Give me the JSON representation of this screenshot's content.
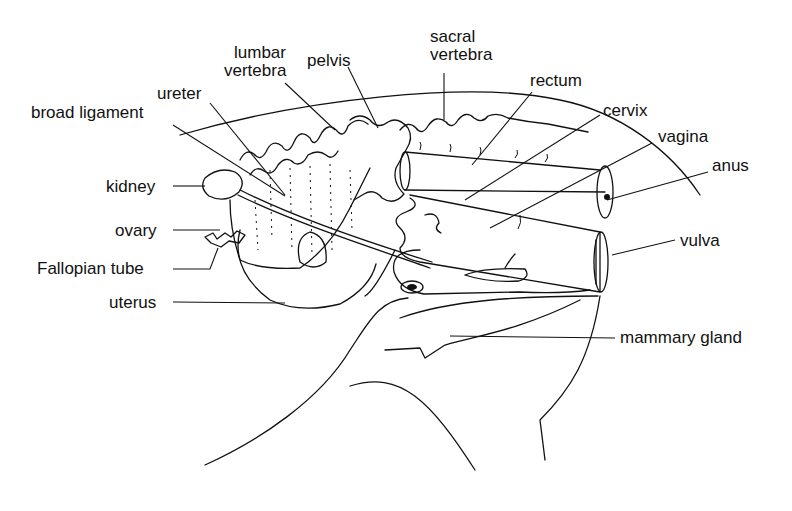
{
  "diagram": {
    "colors": {
      "ink": "#111111",
      "background": "#ffffff"
    },
    "labels": {
      "lumbar_vertebra_line1": "lumbar",
      "lumbar_vertebra_line2": "vertebra",
      "pelvis": "pelvis",
      "sacral_vertebra_line1": "sacral",
      "sacral_vertebra_line2": "vertebra",
      "ureter": "ureter",
      "broad_ligament": "broad ligament",
      "rectum": "rectum",
      "cervix": "cervix",
      "vagina": "vagina",
      "anus": "anus",
      "kidney": "kidney",
      "ovary": "ovary",
      "fallopian_tube": "Fallopian tube",
      "uterus": "uterus",
      "vulva": "vulva",
      "mammary_gland": "mammary gland"
    }
  }
}
